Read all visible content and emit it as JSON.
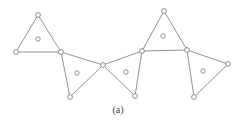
{
  "caption": "(a)",
  "colors": {
    "stroke": "#777777",
    "fill": "#ffffff"
  },
  "nodes": [
    {
      "id": "A",
      "x": 38,
      "y": 15
    },
    {
      "id": "B",
      "x": 16,
      "y": 52
    },
    {
      "id": "C",
      "x": 61,
      "y": 52
    },
    {
      "id": "D",
      "x": 70,
      "y": 97
    },
    {
      "id": "E",
      "x": 103,
      "y": 65
    },
    {
      "id": "F",
      "x": 142,
      "y": 51
    },
    {
      "id": "G",
      "x": 135,
      "y": 96
    },
    {
      "id": "H",
      "x": 164,
      "y": 11
    },
    {
      "id": "I",
      "x": 187,
      "y": 50
    },
    {
      "id": "J",
      "x": 228,
      "y": 64
    },
    {
      "id": "K",
      "x": 194,
      "y": 97
    }
  ],
  "triangles": [
    {
      "vertices": [
        "A",
        "B",
        "C"
      ],
      "center": {
        "x": 38,
        "y": 39
      }
    },
    {
      "vertices": [
        "C",
        "D",
        "E"
      ],
      "center": {
        "x": 77,
        "y": 73
      }
    },
    {
      "vertices": [
        "E",
        "F",
        "G"
      ],
      "center": {
        "x": 126,
        "y": 72
      }
    },
    {
      "vertices": [
        "H",
        "F",
        "I"
      ],
      "center": {
        "x": 163,
        "y": 36
      }
    },
    {
      "vertices": [
        "I",
        "J",
        "K"
      ],
      "center": {
        "x": 203,
        "y": 71
      }
    }
  ]
}
